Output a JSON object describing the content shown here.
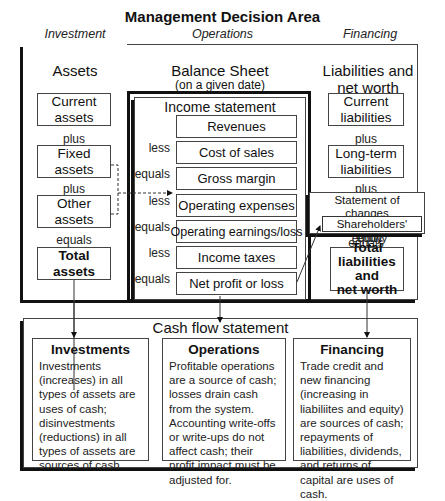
{
  "title": "Management Decision Area",
  "areas": {
    "investment": "Investment",
    "operations": "Operations",
    "financing": "Financing"
  },
  "assets": {
    "heading": "Assets",
    "items": [
      {
        "label": "Current assets",
        "line1": "Current",
        "line2": "assets"
      },
      {
        "label": "Fixed assets",
        "line1": "Fixed",
        "line2": "assets"
      },
      {
        "label": "Other assets",
        "line1": "Other",
        "line2": "assets"
      },
      {
        "label": "Total assets",
        "line1": "Total",
        "line2": "assets"
      }
    ],
    "connectors": [
      "plus",
      "plus",
      "equals"
    ]
  },
  "balance_sheet": {
    "heading": "Balance Sheet",
    "subheading": "(on a given date)"
  },
  "income_statement": {
    "heading": "Income statement",
    "rows": [
      {
        "op": "",
        "label": "Revenues"
      },
      {
        "op": "less",
        "label": "Cost of sales"
      },
      {
        "op": "equals",
        "label": "Gross margin"
      },
      {
        "op": "less",
        "label": "Operating expenses"
      },
      {
        "op": "equals",
        "label": "Operating earnings/loss"
      },
      {
        "op": "less",
        "label": "Income taxes"
      },
      {
        "op": "equals",
        "label": "Net profit or loss"
      }
    ]
  },
  "liabilities": {
    "heading_line1": "Liabilities and",
    "heading_line2": "net worth",
    "items": [
      {
        "line1": "Current",
        "line2": "liabilities"
      },
      {
        "line1": "Long-term",
        "line2": "liabilities"
      }
    ],
    "connectors": [
      "plus",
      "plus",
      "equals"
    ],
    "total": {
      "line1": "Total",
      "line2": "liabilities and",
      "line3": "net worth"
    }
  },
  "equity_statement": {
    "title_line1": "Statement of changes",
    "title_line2": "in shareholders' equity",
    "inner": "Shareholders' equity"
  },
  "cash_flow": {
    "heading": "Cash flow statement",
    "sections": [
      {
        "title": "Investments",
        "text": "Investments (increases) in all types of assets are uses of cash; disinvestments (reductions) in all types of assets are sources of cash."
      },
      {
        "title": "Operations",
        "text": "Profitable operations are a source of cash; losses drain cash from the system. Accounting write-offs or write-ups do not affect cash; their profit impact must be adjusted for."
      },
      {
        "title": "Financing",
        "text": "Trade credit and new financing (increasing in liabiliites and equity) are sources of cash; repayments of liabilities, dividends, and returns of capital are uses of cash."
      }
    ]
  }
}
